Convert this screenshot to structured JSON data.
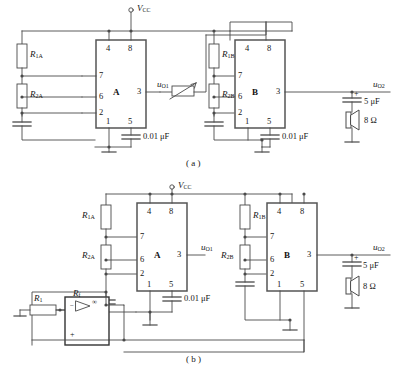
{
  "figure": {
    "captions": {
      "a": "( a )",
      "b": "( b )"
    },
    "colors": {
      "wire": "#4a4a4a",
      "chip_border": "#555555",
      "text": "#161616",
      "background": "#ffffff"
    }
  },
  "circuit_a": {
    "supply_label": "V",
    "supply_sub": "CC",
    "chip_a": {
      "name": "A",
      "pins": {
        "p4": "4",
        "p8": "8",
        "p7": "7",
        "p6": "6",
        "p2": "2",
        "p3": "3",
        "p1": "1",
        "p5": "5"
      }
    },
    "chip_b": {
      "name": "B",
      "pins": {
        "p4": "4",
        "p8": "8",
        "p7": "7",
        "p6": "6",
        "p2": "2",
        "p3": "3",
        "p1": "1",
        "p5": "5"
      }
    },
    "resistors": {
      "r1a": "R",
      "r1a_sub": "1A",
      "r2a": "R",
      "r2a_sub": "2A",
      "r1b": "R",
      "r1b_sub": "1B",
      "r2b": "R",
      "r2b_sub": "2B"
    },
    "capacitors": {
      "c_a": "0.01 μF",
      "c_b": "0.01 μF",
      "c_out": "5 μF",
      "c_out_polarity": "+"
    },
    "speaker": "8 Ω",
    "outputs": {
      "uo1": "u",
      "uo1_sub": "O1",
      "uo2": "u",
      "uo2_sub": "O2"
    },
    "potentiometer_name": "variable-resistor"
  },
  "circuit_b": {
    "supply_label": "V",
    "supply_sub": "CC",
    "chip_a": {
      "name": "A",
      "pins": {
        "p4": "4",
        "p8": "8",
        "p7": "7",
        "p6": "6",
        "p2": "2",
        "p3": "3",
        "p1": "1",
        "p5": "5"
      }
    },
    "chip_b": {
      "name": "B",
      "pins": {
        "p4": "4",
        "p8": "8",
        "p7": "7",
        "p6": "6",
        "p2": "2",
        "p3": "3",
        "p1": "1",
        "p5": "5"
      }
    },
    "resistors": {
      "r1a": "R",
      "r1a_sub": "1A",
      "r2a": "R",
      "r2a_sub": "2A",
      "r1b": "R",
      "r1b_sub": "1B",
      "r2b": "R",
      "r2b_sub": "2B",
      "rf": "R",
      "rf_sub": "f",
      "r1": "R",
      "r1_sub": "1"
    },
    "capacitors": {
      "c_a": "0.01 μF",
      "c_out": "5 μF",
      "c_out_polarity": "+"
    },
    "speaker": "8 Ω",
    "outputs": {
      "uo1": "u",
      "uo1_sub": "O1",
      "uo2": "u",
      "uo2_sub": "O2"
    },
    "opamp": {
      "gain_symbol": "∞",
      "inverting_input": "−",
      "noninverting_input": "+"
    }
  }
}
